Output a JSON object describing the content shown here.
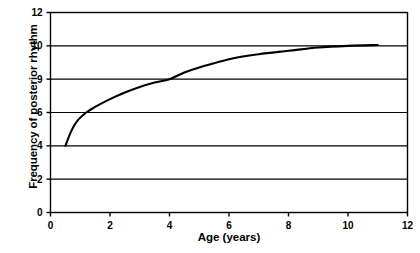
{
  "chart_data": {
    "type": "line",
    "title": "",
    "xlabel": "Age (years)",
    "ylabel": "Frequency of posterior rhythm",
    "xlim": [
      0,
      12
    ],
    "ylim": [
      0,
      12
    ],
    "grid": true,
    "grid_axis": "y",
    "legend": "none",
    "xticks": [
      "0",
      "2",
      "4",
      "6",
      "8",
      "10",
      "12"
    ],
    "xtick_values": [
      0,
      2,
      4,
      6,
      8,
      10,
      12
    ],
    "yticks": [
      "0",
      "2",
      "4",
      "6",
      "9",
      "10",
      "12"
    ],
    "ytick_values": [
      0,
      2,
      4,
      6,
      9,
      10,
      12
    ],
    "ytick_note": "y axis tick labels are non-uniformly spaced as drawn",
    "series": [
      {
        "name": "Posterior rhythm frequency",
        "x": [
          0.5,
          0.7,
          0.9,
          1.2,
          1.5,
          2.0,
          2.5,
          3.0,
          3.5,
          4.0,
          4.5,
          5.0,
          6.0,
          7.0,
          8.0,
          9.0,
          10.0,
          11.0
        ],
        "values": [
          4.0,
          4.9,
          5.5,
          6.0,
          6.5,
          7.2,
          7.8,
          8.3,
          8.7,
          9.0,
          9.2,
          9.35,
          9.6,
          9.75,
          9.85,
          9.95,
          10.0,
          10.05
        ]
      }
    ]
  },
  "style": {
    "line_color": "#000000",
    "axis_color": "#000000",
    "grid_color": "#000000",
    "background": "#ffffff"
  }
}
